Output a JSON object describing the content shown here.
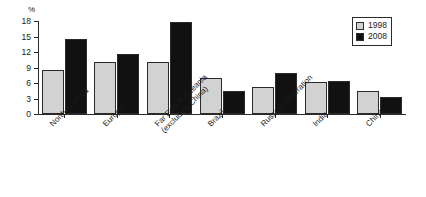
{
  "chart_data": {
    "type": "bar",
    "title": "",
    "xlabel": "",
    "ylabel": "%",
    "ylim": [
      0,
      18
    ],
    "yticks": [
      0,
      3,
      6,
      9,
      12,
      15,
      18
    ],
    "grid": false,
    "legend_position": "top-right",
    "categories": [
      "North America",
      "Europe",
      "Far East & Oceania\n(excluding China)",
      "Brazil",
      "Russian Federation",
      "India",
      "China"
    ],
    "series": [
      {
        "name": "1998",
        "color": "#d2d2d2",
        "values": [
          8.6,
          10.0,
          10.0,
          7.0,
          5.2,
          6.2,
          4.5
        ]
      },
      {
        "name": "2008",
        "color": "#111111",
        "values": [
          14.5,
          11.7,
          17.8,
          4.5,
          7.9,
          6.4,
          3.3
        ]
      }
    ]
  },
  "axis": {
    "unit_label": "%",
    "tick_labels": [
      "18",
      "15",
      "12",
      "9",
      "6",
      "3",
      "0"
    ]
  },
  "legend": {
    "items": [
      {
        "label": "1998",
        "swatch": "legend-swatch-1998"
      },
      {
        "label": "2008",
        "swatch": "legend-swatch-2008"
      }
    ]
  },
  "categories_display": [
    "North America",
    "Europe",
    "Far East & Oceania\n(excluding China)",
    "Brazil",
    "Russian Federation",
    "India",
    "China"
  ]
}
